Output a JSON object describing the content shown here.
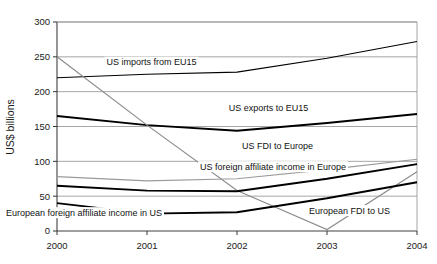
{
  "chart_data": {
    "type": "line",
    "title": "",
    "subtitle": "",
    "xlabel": "",
    "ylabel": "US$ billions",
    "x": [
      "2000",
      "2001",
      "2002",
      "2003",
      "2004"
    ],
    "categories": [
      "2000",
      "2001",
      "2002",
      "2003",
      "2004"
    ],
    "xlim": [
      2000,
      2004
    ],
    "ylim": [
      0,
      300
    ],
    "yticks": [
      0,
      50,
      100,
      150,
      200,
      250,
      300
    ],
    "ytick_labels": [
      "0",
      "50",
      "100",
      "150",
      "200",
      "250",
      "300"
    ],
    "xtick_labels": [
      "2000",
      "2001",
      "2002",
      "2003",
      "2004"
    ],
    "grid": "horizontal",
    "legend": "inline-labels",
    "series": [
      {
        "name": "US imports from EU15",
        "label": "US imports from EU15",
        "color": "#000000",
        "width": 1.2,
        "values": [
          220,
          225,
          228,
          248,
          272
        ],
        "label_x": 2001.05,
        "label_y": 238
      },
      {
        "name": "US exports to EU15",
        "label": "US exports to EU15",
        "color": "#000000",
        "width": 1.9,
        "values": [
          165,
          152,
          144,
          155,
          168
        ],
        "label_x": 2002.35,
        "label_y": 172
      },
      {
        "name": "European FDI to US",
        "label": "European FDI to US",
        "color": "#8c8c8c",
        "width": 1.2,
        "values": [
          250,
          152,
          58,
          2,
          85
        ],
        "label_x": 2003.25,
        "label_y": 25
      },
      {
        "name": "US FDI to Europe",
        "label": "US FDI to Europe",
        "color": "#9a9a9a",
        "width": 1.2,
        "values": [
          78,
          72,
          75,
          88,
          103
        ],
        "label_x": 2002.45,
        "label_y": 118
      },
      {
        "name": "US foreign affiliate income in Europe",
        "label": "US foreign affiliate income in Europe",
        "color": "#000000",
        "width": 1.9,
        "values": [
          65,
          58,
          57,
          75,
          96
        ],
        "label_x": 2002.4,
        "label_y": 88
      },
      {
        "name": "European foreign affiliate income in US",
        "label": "European foreign affiliate income in US",
        "color": "#000000",
        "width": 1.9,
        "values": [
          40,
          25,
          27,
          47,
          70
        ],
        "label_x": 2000.3,
        "label_y": 22
      }
    ]
  },
  "axes": {
    "y_title": "US$ billions"
  }
}
